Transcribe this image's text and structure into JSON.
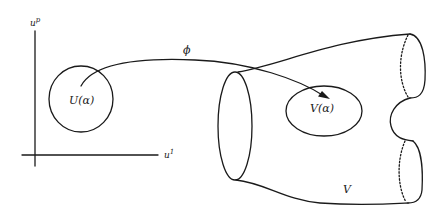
{
  "figure": {
    "axes": {
      "vertical_label": "u",
      "vertical_label_sup": "p",
      "horizontal_label": "u",
      "horizontal_label_sup": "1"
    },
    "domain_region_label": "U(α)",
    "map_label": "ϕ",
    "image_region_label": "V(α)",
    "manifold_label": "V",
    "stroke_color": "#1a1a1a",
    "background": "#ffffff"
  }
}
